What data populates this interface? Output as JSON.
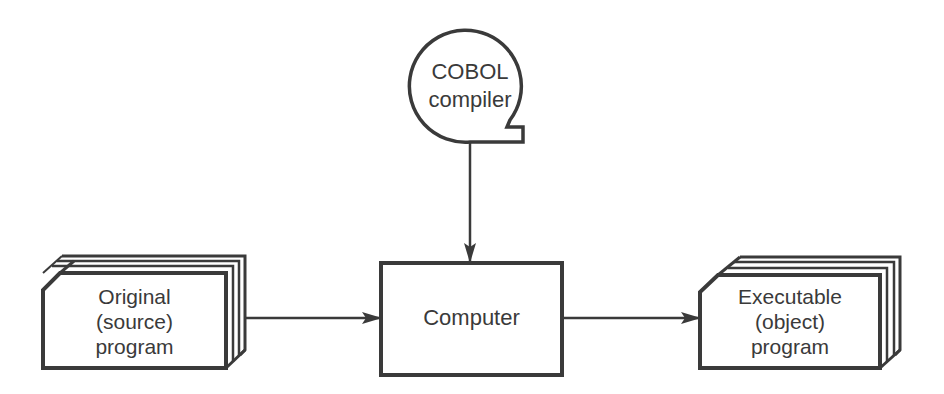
{
  "diagram": {
    "title": "",
    "nodes": {
      "compiler": {
        "shape": "magnetic-tape",
        "lines": [
          "COBOL",
          "compiler"
        ]
      },
      "source": {
        "shape": "card-deck",
        "lines": [
          "Original",
          "(source)",
          "program"
        ]
      },
      "computer": {
        "shape": "process-box",
        "lines": [
          "Computer"
        ]
      },
      "object": {
        "shape": "card-deck",
        "lines": [
          "Executable",
          "(object)",
          "program"
        ]
      }
    },
    "edges": [
      {
        "from": "compiler",
        "to": "computer"
      },
      {
        "from": "source",
        "to": "computer"
      },
      {
        "from": "computer",
        "to": "object"
      }
    ],
    "colors": {
      "stroke": "#3a3a3a",
      "text": "#3a3a3a",
      "background": "#ffffff"
    }
  }
}
